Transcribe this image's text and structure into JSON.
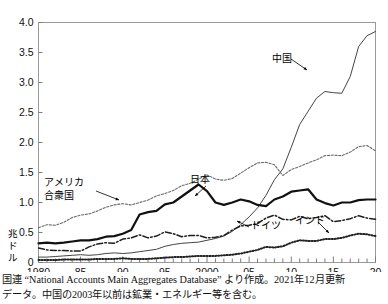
{
  "chart_data": {
    "type": "line",
    "title": "",
    "xlabel": "",
    "ylabel": "兆ドル",
    "unit_label": "兆ドル",
    "unit_chars": [
      "兆",
      "ド",
      "ル"
    ],
    "xlim": [
      1980,
      2020
    ],
    "ylim": [
      0,
      4.0
    ],
    "grid": false,
    "legend_position": "inline-annotations",
    "x_tick_labels": [
      "1980",
      "85",
      "90",
      "95",
      "2000",
      "05",
      "10",
      "15",
      "20"
    ],
    "x_tick_values": [
      1980,
      1985,
      1990,
      1995,
      2000,
      2005,
      2010,
      2015,
      2020
    ],
    "y_tick_labels": [
      "0",
      "0.5",
      "1.0",
      "1.5",
      "2.0",
      "2.5",
      "3.0",
      "3.5",
      "4.0"
    ],
    "y_tick_values": [
      0,
      0.5,
      1.0,
      1.5,
      2.0,
      2.5,
      3.0,
      3.5,
      4.0
    ],
    "x": [
      1980,
      1981,
      1982,
      1983,
      1984,
      1985,
      1986,
      1987,
      1988,
      1989,
      1990,
      1991,
      1992,
      1993,
      1994,
      1995,
      1996,
      1997,
      1998,
      1999,
      2000,
      2001,
      2002,
      2003,
      2004,
      2005,
      2006,
      2007,
      2008,
      2009,
      2010,
      2011,
      2012,
      2013,
      2014,
      2015,
      2016,
      2017,
      2018,
      2019,
      2020
    ],
    "series": [
      {
        "name": "中国",
        "label": "中国",
        "style": "thin-solid",
        "color": "#444444",
        "values": [
          0.09,
          0.09,
          0.1,
          0.11,
          0.12,
          0.13,
          0.12,
          0.13,
          0.15,
          0.16,
          0.15,
          0.16,
          0.18,
          0.2,
          0.22,
          0.27,
          0.3,
          0.32,
          0.33,
          0.34,
          0.37,
          0.4,
          0.44,
          0.52,
          0.63,
          0.76,
          0.91,
          1.12,
          1.38,
          1.56,
          1.92,
          2.3,
          2.52,
          2.74,
          2.85,
          2.83,
          2.82,
          3.1,
          3.6,
          3.78,
          3.85
        ]
      },
      {
        "name": "アメリカ合衆国",
        "label_lines": [
          "アメリカ",
          "合衆国"
        ],
        "style": "dotted-fine",
        "color": "#6b6b6b",
        "values": [
          0.58,
          0.63,
          0.62,
          0.67,
          0.75,
          0.79,
          0.81,
          0.86,
          0.92,
          0.96,
          0.98,
          0.96,
          1.0,
          1.04,
          1.11,
          1.15,
          1.2,
          1.28,
          1.32,
          1.39,
          1.46,
          1.39,
          1.37,
          1.4,
          1.49,
          1.58,
          1.66,
          1.67,
          1.63,
          1.45,
          1.55,
          1.6,
          1.66,
          1.71,
          1.78,
          1.79,
          1.78,
          1.84,
          1.93,
          1.95,
          1.86
        ]
      },
      {
        "name": "日本",
        "label": "日本",
        "style": "thick-solid",
        "color": "#111111",
        "values": [
          0.32,
          0.33,
          0.32,
          0.33,
          0.35,
          0.37,
          0.37,
          0.39,
          0.43,
          0.44,
          0.48,
          0.54,
          0.8,
          0.84,
          0.86,
          0.97,
          1.0,
          1.1,
          1.2,
          1.3,
          1.19,
          1.0,
          0.96,
          1.0,
          1.05,
          1.02,
          0.96,
          0.94,
          1.05,
          1.1,
          1.18,
          1.2,
          1.22,
          1.05,
          0.99,
          0.95,
          1.0,
          1.0,
          1.04,
          1.05,
          1.05
        ]
      },
      {
        "name": "ドイツ",
        "label": "ドイツ",
        "style": "dash-dot",
        "color": "#1f1f1f",
        "values": [
          0.24,
          0.21,
          0.2,
          0.2,
          0.19,
          0.19,
          0.26,
          0.31,
          0.33,
          0.32,
          0.39,
          0.41,
          0.46,
          0.41,
          0.44,
          0.51,
          0.48,
          0.43,
          0.45,
          0.45,
          0.41,
          0.42,
          0.45,
          0.54,
          0.61,
          0.62,
          0.65,
          0.74,
          0.79,
          0.72,
          0.71,
          0.77,
          0.73,
          0.75,
          0.78,
          0.68,
          0.7,
          0.73,
          0.78,
          0.74,
          0.72
        ]
      },
      {
        "name": "インド",
        "label": "インド",
        "style": "dotted-bold",
        "color": "#222222",
        "values": [
          0.04,
          0.04,
          0.04,
          0.05,
          0.05,
          0.05,
          0.05,
          0.06,
          0.06,
          0.06,
          0.07,
          0.06,
          0.06,
          0.06,
          0.07,
          0.08,
          0.09,
          0.09,
          0.1,
          0.11,
          0.11,
          0.11,
          0.12,
          0.13,
          0.15,
          0.18,
          0.21,
          0.26,
          0.25,
          0.27,
          0.33,
          0.37,
          0.36,
          0.36,
          0.39,
          0.39,
          0.41,
          0.45,
          0.48,
          0.47,
          0.44
        ]
      }
    ],
    "annotations": [
      {
        "name": "china-label",
        "text": "中国",
        "x_px": 272,
        "y_px": 62
      },
      {
        "name": "usa-label",
        "text_lines": [
          "アメリカ",
          "合衆国"
        ],
        "x_px": 44,
        "y_px": 186
      },
      {
        "name": "japan-label",
        "text": "日本",
        "x_px": 190,
        "y_px": 183
      },
      {
        "name": "germany-label",
        "text": "ドイツ",
        "x_px": 251,
        "y_px": 229
      },
      {
        "name": "india-label",
        "text": "インド",
        "x_px": 295,
        "y_px": 224
      }
    ]
  },
  "source_note": {
    "line1": "国連 “National Accounts Main Aggregates Database” より作成。2021年12月更新",
    "line2": "データ。中国の2003年以前は鉱業・エネルギー等を含む。"
  }
}
